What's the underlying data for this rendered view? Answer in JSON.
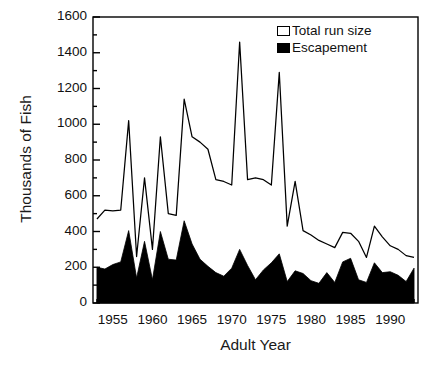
{
  "chart_data": {
    "type": "area",
    "title": "",
    "xlabel": "Adult Year",
    "ylabel": "Thousands of Fish",
    "xlim": [
      1952.5,
      1993.5
    ],
    "ylim": [
      0,
      1600
    ],
    "grid": false,
    "legend_position": "top-right",
    "y_ticks": [
      0,
      200,
      400,
      600,
      800,
      1000,
      1200,
      1400,
      1600
    ],
    "y_minor_step": 100,
    "x_ticks": [
      1955,
      1960,
      1965,
      1970,
      1975,
      1980,
      1985,
      1990
    ],
    "x_minor_step": 1,
    "x": [
      1953,
      1954,
      1955,
      1956,
      1957,
      1958,
      1959,
      1960,
      1961,
      1962,
      1963,
      1964,
      1965,
      1966,
      1967,
      1968,
      1969,
      1970,
      1971,
      1972,
      1973,
      1974,
      1975,
      1976,
      1977,
      1978,
      1979,
      1980,
      1981,
      1982,
      1983,
      1984,
      1985,
      1986,
      1987,
      1988,
      1989,
      1990,
      1991,
      1992,
      1993
    ],
    "series": [
      {
        "name": "Total run size",
        "style": "open-line",
        "color": "#000000",
        "values": [
          470,
          520,
          515,
          520,
          1020,
          260,
          700,
          300,
          930,
          500,
          490,
          1140,
          930,
          900,
          860,
          690,
          680,
          660,
          1460,
          690,
          700,
          690,
          660,
          1290,
          430,
          680,
          405,
          380,
          350,
          330,
          310,
          395,
          390,
          345,
          255,
          430,
          370,
          320,
          300,
          265,
          255
        ]
      },
      {
        "name": "Escapement",
        "style": "filled-area",
        "color": "#000000",
        "values": [
          200,
          190,
          215,
          230,
          405,
          140,
          345,
          130,
          400,
          245,
          240,
          460,
          330,
          245,
          205,
          170,
          150,
          195,
          300,
          210,
          130,
          185,
          225,
          275,
          120,
          180,
          165,
          125,
          110,
          170,
          115,
          230,
          250,
          130,
          115,
          225,
          170,
          175,
          155,
          120,
          195
        ]
      }
    ]
  },
  "legend": {
    "items": [
      {
        "label": "Total run size",
        "swatch": "open-square"
      },
      {
        "label": "Escapement",
        "swatch": "filled-square"
      }
    ]
  },
  "axes": {
    "y_tick_labels": [
      "1600",
      "1400",
      "1200",
      "1000",
      "800",
      "600",
      "400",
      "200",
      "0"
    ],
    "x_tick_labels": [
      "1955",
      "1960",
      "1965",
      "1970",
      "1975",
      "1980",
      "1985",
      "1990"
    ]
  }
}
